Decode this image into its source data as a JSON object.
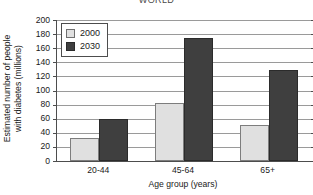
{
  "chart_data": {
    "type": "bar",
    "title": "WORLD",
    "xlabel": "Age group (years)",
    "ylabel": "Estimated number of people with diabetes (millions)",
    "ylabel_line1": "Estimated number of people",
    "ylabel_line2": "with diabetes (millions)",
    "categories": [
      "20-44",
      "45-64",
      "65+"
    ],
    "series": [
      {
        "name": "2000",
        "color": "#e0e0e0",
        "values": [
          33,
          83,
          51
        ]
      },
      {
        "name": "2030",
        "color": "#3f3f3f",
        "values": [
          59,
          175,
          129
        ]
      }
    ],
    "ylim": [
      0,
      200
    ],
    "yticks": [
      200,
      180,
      160,
      140,
      120,
      100,
      80,
      60,
      40,
      20,
      0
    ],
    "ytick_labels": [
      "200",
      "180",
      "160",
      "140",
      "120",
      "100",
      "80",
      "60",
      "40",
      "20",
      "0"
    ],
    "grid": true,
    "grid_axis": "y",
    "legend_position": "top-left-inside",
    "legend_entries": [
      "2000",
      "2030"
    ]
  }
}
